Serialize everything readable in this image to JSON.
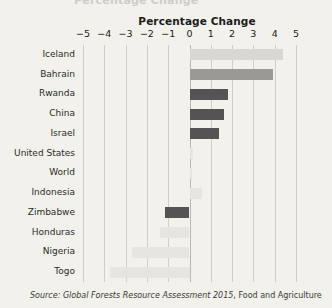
{
  "figure": {
    "clipped_title": "Percentage Change",
    "source_prefix": "Source:",
    "source_italic": "Global Forests Resource Assessment 2015",
    "source_rest": ", Food and Agriculture"
  },
  "colors": {
    "background": "#f2f1ec",
    "gridline": "#cfcec8",
    "bar_dark": "#545454",
    "bar_mid": "#9a9a95",
    "bar_light": "#d8d7d1",
    "bar_faint": "#e6e5df",
    "text": "#1b1b1b"
  },
  "chart_data": {
    "type": "bar",
    "orientation": "horizontal",
    "title": "Percentage Change",
    "xlabel": "Percentage Change",
    "ylabel": "",
    "xlim": [
      -5,
      5
    ],
    "xticks": [
      -5,
      -4,
      -3,
      -2,
      -1,
      0,
      1,
      2,
      3,
      4,
      5
    ],
    "xticklabels": [
      "−5",
      "−4",
      "−3",
      "−2",
      "−1",
      "0",
      "1",
      "2",
      "3",
      "4",
      "5"
    ],
    "grid": true,
    "grid_axis": "x",
    "legend": false,
    "categories": [
      "Iceland",
      "Bahrain",
      "Rwanda",
      "China",
      "Israel",
      "United States",
      "World",
      "Indonesia",
      "Zimbabwe",
      "Honduras",
      "Nigeria",
      "Togo"
    ],
    "values": [
      4.4,
      3.9,
      1.8,
      1.6,
      1.4,
      0.15,
      0.1,
      0.6,
      -1.15,
      -1.4,
      -2.7,
      -3.75
    ],
    "bar_shades": [
      "light",
      "mid",
      "dark",
      "dark",
      "dark",
      "faint",
      "faint",
      "faint",
      "dark",
      "faint",
      "faint",
      "faint"
    ]
  }
}
